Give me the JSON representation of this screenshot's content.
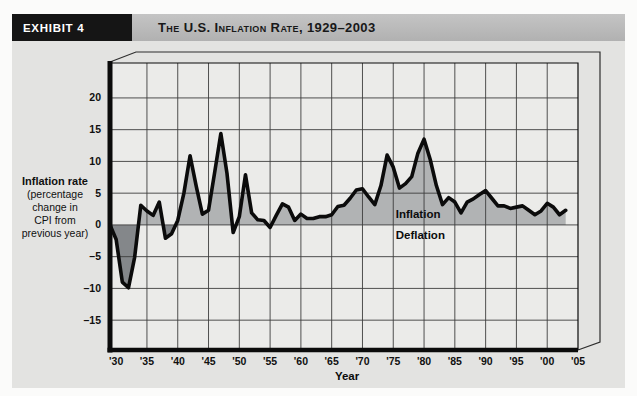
{
  "exhibit": {
    "badge": "EXHIBIT 4",
    "title": "The U.S. Inflation Rate, 1929–2003"
  },
  "y_axis_label": {
    "line1": "Inflation rate",
    "line2": "(percentage",
    "line3": "change in",
    "line4": "CPI from",
    "line5": "previous year)"
  },
  "annotations": {
    "inflation": "Inflation",
    "deflation": "Deflation"
  },
  "chart_data": {
    "type": "area",
    "title": "The U.S. Inflation Rate, 1929–2003",
    "xlabel": "Year",
    "ylabel": "Inflation rate (percentage change in CPI from previous year)",
    "grid": true,
    "xlim": [
      1929,
      2005
    ],
    "ylim": [
      -19.7,
      25.5
    ],
    "zero_baseline": 0,
    "years": [
      1929,
      1930,
      1931,
      1932,
      1933,
      1934,
      1935,
      1936,
      1937,
      1938,
      1939,
      1940,
      1941,
      1942,
      1943,
      1944,
      1945,
      1946,
      1947,
      1948,
      1949,
      1950,
      1951,
      1952,
      1953,
      1954,
      1955,
      1956,
      1957,
      1958,
      1959,
      1960,
      1961,
      1962,
      1963,
      1964,
      1965,
      1966,
      1967,
      1968,
      1969,
      1970,
      1971,
      1972,
      1973,
      1974,
      1975,
      1976,
      1977,
      1978,
      1979,
      1980,
      1981,
      1982,
      1983,
      1984,
      1985,
      1986,
      1987,
      1988,
      1989,
      1990,
      1991,
      1992,
      1993,
      1994,
      1995,
      1996,
      1997,
      1998,
      1999,
      2000,
      2001,
      2002,
      2003
    ],
    "values": [
      0.0,
      -2.3,
      -9.0,
      -9.9,
      -5.1,
      3.1,
      2.2,
      1.5,
      3.6,
      -2.1,
      -1.4,
      0.7,
      5.0,
      10.9,
      6.1,
      1.7,
      2.3,
      8.3,
      14.4,
      8.1,
      -1.2,
      1.3,
      7.9,
      1.9,
      0.8,
      0.7,
      -0.4,
      1.5,
      3.3,
      2.8,
      0.7,
      1.7,
      1.0,
      1.0,
      1.3,
      1.3,
      1.6,
      2.9,
      3.1,
      4.2,
      5.5,
      5.7,
      4.4,
      3.2,
      6.2,
      11.0,
      9.1,
      5.8,
      6.5,
      7.6,
      11.3,
      13.5,
      10.3,
      6.2,
      3.2,
      4.3,
      3.6,
      1.9,
      3.6,
      4.1,
      4.8,
      5.4,
      4.2,
      3.0,
      3.0,
      2.6,
      2.8,
      3.0,
      2.3,
      1.6,
      2.2,
      3.4,
      2.8,
      1.6,
      2.3
    ],
    "x_tick_years": [
      1930,
      1935,
      1940,
      1945,
      1950,
      1955,
      1960,
      1965,
      1970,
      1975,
      1980,
      1985,
      1990,
      1995,
      2000,
      2005
    ],
    "x_tick_labels": [
      "'30",
      "'35",
      "'40",
      "'45",
      "'50",
      "'55",
      "'60",
      "'65",
      "'70",
      "'75",
      "'80",
      "'85",
      "'90",
      "'95",
      "'00",
      "'05"
    ],
    "y_tick_values": [
      20,
      15,
      10,
      5,
      0,
      -5,
      -10,
      -15
    ],
    "y_tick_labels": [
      "20",
      "15",
      "10",
      "5",
      "0",
      "–5",
      "–10",
      "–15"
    ],
    "colors": {
      "inflation_fill": "#b1b3b4",
      "deflation_fill": "#84878a",
      "line": "#0b0b0b",
      "plot_bg": "#ebebe9",
      "card_bg": "#e3e3e1",
      "title_bar_bg": "#b9b9b9",
      "badge_bg": "#151515",
      "badge_text": "#ffffff",
      "grid": "#3d3d3d",
      "shell": "#2e2e2e"
    }
  }
}
